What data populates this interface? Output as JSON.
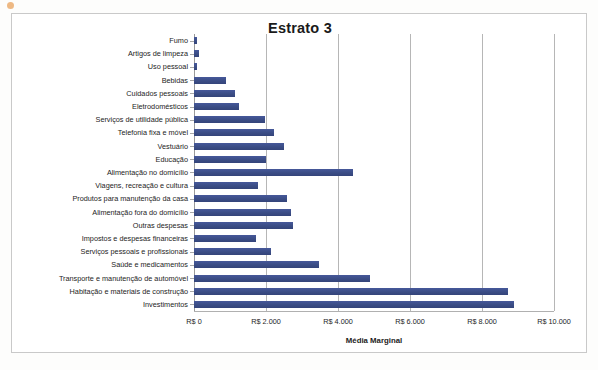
{
  "chart_data": {
    "type": "bar",
    "orientation": "horizontal",
    "title": "Estrato 3",
    "xlabel": "Média Marginal",
    "ylabel": "",
    "xlim": [
      0,
      10000
    ],
    "xticks": [
      0,
      2000,
      4000,
      6000,
      8000,
      10000
    ],
    "xtick_labels": [
      "R$ 0",
      "R$ 2.000",
      "R$ 4.000",
      "R$ 6.000",
      "R$ 8.000",
      "R$ 10.000"
    ],
    "grid": true,
    "legend": false,
    "bar_color": "#41558f",
    "categories": [
      "Fumo",
      "Artigos de limpeza",
      "Uso pessoal",
      "Bebidas",
      "Cuidados pessoais",
      "Eletrodomésticos",
      "Serviços de utilidade pública",
      "Telefonia fixa e móvel",
      "Vestuário",
      "Educação",
      "Alimentação no domicílio",
      "Viagens, recreação e cultura",
      "Produtos para manutenção da casa",
      "Alimentação fora do domicílio",
      "Outras despesas",
      "Impostos e despesas financeiras",
      "Serviços pessoais e profissionais",
      "Saúde e medicamentos",
      "Transporte e manutenção de automóvel",
      "Habitação e materiais de construção",
      "Investimentos"
    ],
    "values": [
      90,
      130,
      70,
      890,
      1140,
      1250,
      1970,
      2220,
      2500,
      2000,
      4430,
      1780,
      2580,
      2700,
      2740,
      1730,
      2150,
      3480,
      4900,
      8730,
      8880
    ]
  }
}
